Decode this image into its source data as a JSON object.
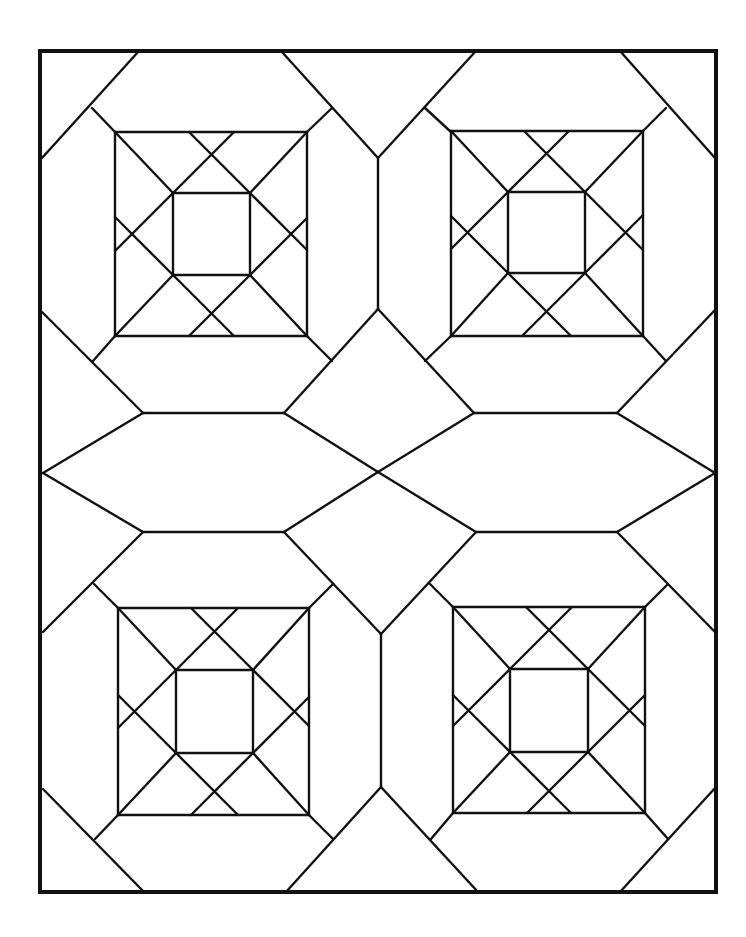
{
  "diagram": {
    "type": "quilt-block-pattern",
    "colors": {
      "line": "#111111",
      "background": "#ffffff"
    },
    "border": {
      "x1": 40,
      "y1": 51,
      "x2": 716,
      "y2": 892
    },
    "blocks": [
      {
        "name": "top-left",
        "outer": [
          115,
          132,
          307,
          336
        ],
        "inner": [
          173,
          193,
          250,
          275
        ]
      },
      {
        "name": "top-right",
        "outer": [
          451,
          131,
          643,
          336
        ],
        "inner": [
          508,
          192,
          585,
          273
        ]
      },
      {
        "name": "bottom-left",
        "outer": [
          118,
          608,
          309,
          815
        ],
        "inner": [
          176,
          670,
          253,
          753
        ]
      },
      {
        "name": "bottom-right",
        "outer": [
          453,
          607,
          645,
          813
        ],
        "inner": [
          510,
          669,
          588,
          752
        ]
      }
    ],
    "lines": [
      [
        138,
        52,
        42,
        158
      ],
      [
        92,
        108,
        115,
        132
      ],
      [
        282,
        52,
        378,
        158
      ],
      [
        332,
        108,
        307,
        132
      ],
      [
        475,
        52,
        378,
        158
      ],
      [
        425,
        108,
        451,
        132
      ],
      [
        620,
        51,
        715,
        158
      ],
      [
        666,
        108,
        643,
        131
      ],
      [
        378,
        158,
        378,
        309
      ],
      [
        42,
        312,
        143,
        413
      ],
      [
        93,
        361,
        115,
        336
      ],
      [
        284,
        413,
        378,
        309
      ],
      [
        332,
        361,
        307,
        336
      ],
      [
        378,
        309,
        474,
        413
      ],
      [
        425,
        361,
        451,
        336
      ],
      [
        715,
        310,
        617,
        413
      ],
      [
        666,
        361,
        643,
        336
      ],
      [
        143,
        413,
        284,
        413
      ],
      [
        474,
        413,
        617,
        413
      ],
      [
        43,
        473,
        143,
        413
      ],
      [
        284,
        413,
        378,
        472
      ],
      [
        378,
        472,
        474,
        413
      ],
      [
        617,
        413,
        715,
        473
      ],
      [
        43,
        473,
        143,
        532
      ],
      [
        284,
        532,
        378,
        472
      ],
      [
        378,
        472,
        476,
        532
      ],
      [
        617,
        532,
        715,
        473
      ],
      [
        143,
        532,
        284,
        532
      ],
      [
        476,
        532,
        617,
        532
      ],
      [
        143,
        532,
        43,
        632
      ],
      [
        94,
        584,
        118,
        608
      ],
      [
        284,
        532,
        381,
        634
      ],
      [
        333,
        584,
        309,
        608
      ],
      [
        476,
        532,
        381,
        634
      ],
      [
        430,
        584,
        453,
        607
      ],
      [
        617,
        532,
        715,
        632
      ],
      [
        668,
        584,
        645,
        607
      ],
      [
        381,
        634,
        381,
        787
      ],
      [
        43,
        789,
        144,
        892
      ],
      [
        95,
        839,
        118,
        815
      ],
      [
        286,
        892,
        381,
        787
      ],
      [
        333,
        839,
        309,
        815
      ],
      [
        381,
        787,
        478,
        892
      ],
      [
        431,
        839,
        453,
        813
      ],
      [
        620,
        892,
        716,
        787
      ],
      [
        668,
        839,
        645,
        813
      ]
    ]
  }
}
